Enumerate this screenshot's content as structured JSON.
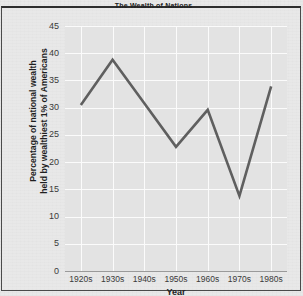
{
  "figure": {
    "title": "The Wealth of Nations",
    "background_color": "#e8e8e8",
    "plot_background_color": "#e3e3e3",
    "gridline_color": "#fbfbfb",
    "line_color": "#5f5f5f",
    "border_color": "#2e2e2e"
  },
  "axes": {
    "y_title_line1": "Percentage of national wealth",
    "y_title_line2": "held by wealthiest 1% of Americans",
    "x_title": "Year"
  },
  "chart_data": {
    "type": "line",
    "title": "The Wealth of Nations",
    "xlabel": "Year",
    "ylabel": "Percentage of national wealth held by wealthiest 1% of Americans",
    "categories": [
      "1920s",
      "1930s",
      "1940s",
      "1950s",
      "1960s",
      "1970s",
      "1980s"
    ],
    "values": [
      30.5,
      38.8,
      30.8,
      22.8,
      29.6,
      13.8,
      33.9
    ],
    "yticks": [
      0,
      5,
      10,
      15,
      20,
      25,
      30,
      35,
      40,
      45
    ],
    "ylim": [
      0,
      45
    ],
    "grid": true,
    "legend": "none",
    "series": [
      {
        "name": "Percentage of national wealth held by wealthiest 1% of Americans",
        "values": [
          30.5,
          38.8,
          30.8,
          22.8,
          29.6,
          13.8,
          33.9
        ]
      }
    ]
  }
}
